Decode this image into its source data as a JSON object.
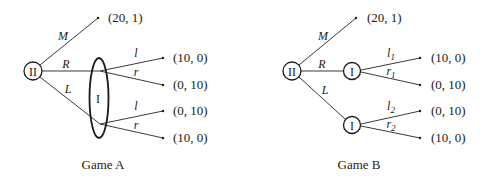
{
  "games": [
    {
      "caption": "Game A",
      "root": {
        "player": "II"
      },
      "branches": {
        "M": {
          "label": "M",
          "payoff": "(20, 1)"
        },
        "R": {
          "label": "R"
        },
        "L": {
          "label": "L"
        }
      },
      "info_set": {
        "player": "I",
        "type": "single information set (ellipse) containing both nodes"
      },
      "after_R": [
        {
          "label": "l",
          "payoff": "(10, 0)"
        },
        {
          "label": "r",
          "payoff": "(0, 10)"
        }
      ],
      "after_L": [
        {
          "label": "l",
          "payoff": "(0, 10)"
        },
        {
          "label": "r",
          "payoff": "(10, 0)"
        }
      ]
    },
    {
      "caption": "Game B",
      "root": {
        "player": "II"
      },
      "branches": {
        "M": {
          "label": "M",
          "payoff": "(20, 1)"
        },
        "R": {
          "label": "R"
        },
        "L": {
          "label": "L"
        }
      },
      "node_R": {
        "player": "I"
      },
      "node_L": {
        "player": "I"
      },
      "after_R": [
        {
          "label": "l",
          "sub": "1",
          "payoff": "(10, 0)"
        },
        {
          "label": "r",
          "sub": "1",
          "payoff": "(0, 10)"
        }
      ],
      "after_L": [
        {
          "label": "l",
          "sub": "2",
          "payoff": "(0, 10)"
        },
        {
          "label": "r",
          "sub": "2",
          "payoff": "(10, 0)"
        }
      ]
    }
  ]
}
